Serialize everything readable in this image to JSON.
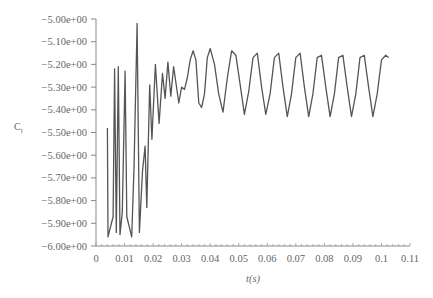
{
  "chart_data": {
    "type": "line",
    "title": "",
    "xlabel": "t(s)",
    "ylabel": "C_l",
    "xlim": [
      0,
      0.11
    ],
    "ylim": [
      -6.0,
      -5.0
    ],
    "grid": false,
    "legend": null,
    "x_ticks": [
      "0",
      "0.01",
      "0.02",
      "0.03",
      "0.04",
      "0.05",
      "0.06",
      "0.07",
      "0.08",
      "0.09",
      "0.1",
      "0.11"
    ],
    "y_ticks": [
      "-5.00e+00",
      "-5.10e+00",
      "-5.20e+00",
      "-5.30e+00",
      "-5.40e+00",
      "-5.50e+00",
      "-5.60e+00",
      "-5.70e+00",
      "-5.80e+00",
      "-5.90e+00",
      "-6.00e+00"
    ],
    "series": [
      {
        "name": "C_l",
        "color": "#555555",
        "x": [
          0.004,
          0.0042,
          0.006,
          0.0065,
          0.0071,
          0.0078,
          0.0084,
          0.0092,
          0.0102,
          0.0108,
          0.0125,
          0.0133,
          0.0144,
          0.0152,
          0.0163,
          0.0172,
          0.0178,
          0.0188,
          0.0196,
          0.0208,
          0.0221,
          0.0233,
          0.0242,
          0.0252,
          0.0262,
          0.0272,
          0.028,
          0.029,
          0.03,
          0.031,
          0.032,
          0.033,
          0.034,
          0.035,
          0.036,
          0.037,
          0.038,
          0.039,
          0.04,
          0.0415,
          0.043,
          0.0445,
          0.046,
          0.0475,
          0.049,
          0.0505,
          0.052,
          0.0535,
          0.055,
          0.0565,
          0.058,
          0.0595,
          0.061,
          0.0625,
          0.064,
          0.0655,
          0.067,
          0.0685,
          0.07,
          0.0715,
          0.073,
          0.0745,
          0.076,
          0.0775,
          0.079,
          0.0805,
          0.082,
          0.0835,
          0.085,
          0.0865,
          0.088,
          0.0895,
          0.091,
          0.0925,
          0.094,
          0.0955,
          0.097,
          0.0985,
          0.1,
          0.1015,
          0.1025
        ],
        "y": [
          -5.48,
          -5.96,
          -5.87,
          -5.22,
          -5.94,
          -5.21,
          -5.95,
          -5.85,
          -5.23,
          -5.87,
          -5.96,
          -5.66,
          -5.02,
          -5.94,
          -5.67,
          -5.56,
          -5.83,
          -5.29,
          -5.53,
          -5.2,
          -5.46,
          -5.24,
          -5.35,
          -5.19,
          -5.34,
          -5.21,
          -5.28,
          -5.37,
          -5.3,
          -5.31,
          -5.26,
          -5.18,
          -5.14,
          -5.18,
          -5.37,
          -5.39,
          -5.33,
          -5.17,
          -5.13,
          -5.2,
          -5.33,
          -5.41,
          -5.26,
          -5.14,
          -5.16,
          -5.29,
          -5.42,
          -5.32,
          -5.17,
          -5.15,
          -5.3,
          -5.42,
          -5.33,
          -5.17,
          -5.15,
          -5.3,
          -5.43,
          -5.33,
          -5.17,
          -5.15,
          -5.3,
          -5.43,
          -5.33,
          -5.17,
          -5.16,
          -5.3,
          -5.43,
          -5.33,
          -5.17,
          -5.16,
          -5.3,
          -5.43,
          -5.33,
          -5.17,
          -5.16,
          -5.3,
          -5.43,
          -5.33,
          -5.18,
          -5.16,
          -5.17
        ]
      }
    ]
  },
  "axes": {
    "xlabel": "t(s)",
    "ylabel_main": "C",
    "ylabel_sub": "l"
  }
}
